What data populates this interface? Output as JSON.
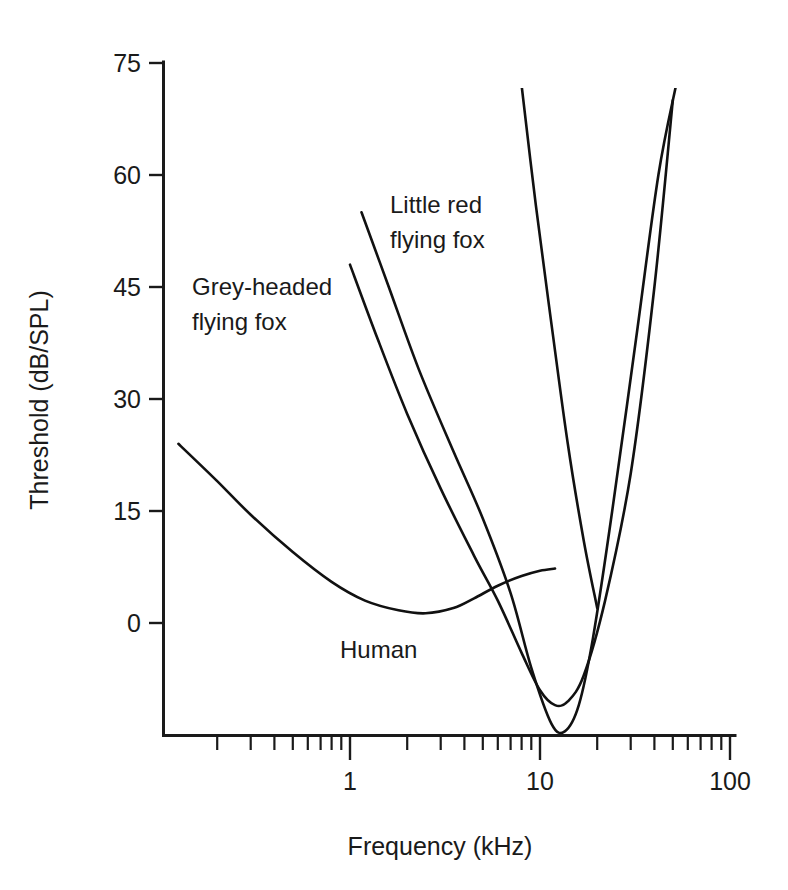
{
  "chart_data": {
    "type": "line",
    "title": "",
    "xlabel": "Frequency (kHz)",
    "ylabel": "Threshold (dB/SPL)",
    "xscale": "log",
    "xlim": [
      0.12,
      100
    ],
    "ylim": [
      -20,
      75
    ],
    "grid": false,
    "legend": "inline-annotations",
    "x_ticks": [
      "1",
      "10",
      "100"
    ],
    "x_tick_values": [
      1,
      10,
      100
    ],
    "y_ticks": [
      "0",
      "15",
      "30",
      "45",
      "60",
      "75"
    ],
    "y_tick_values": [
      0,
      15,
      30,
      45,
      60,
      75
    ],
    "series": [
      {
        "name": "Human",
        "label_text": "Human",
        "points": [
          [
            0.125,
            24.0
          ],
          [
            0.2,
            19.0
          ],
          [
            0.3,
            14.5
          ],
          [
            0.5,
            9.5
          ],
          [
            0.8,
            5.5
          ],
          [
            1.2,
            3.0
          ],
          [
            1.8,
            1.7
          ],
          [
            2.5,
            1.3
          ],
          [
            3.5,
            2.0
          ],
          [
            4.5,
            3.3
          ],
          [
            6.0,
            5.0
          ],
          [
            8.0,
            6.3
          ],
          [
            10.0,
            7.0
          ],
          [
            12.0,
            7.3
          ]
        ]
      },
      {
        "name": "Grey-headed flying fox",
        "label_text": "Grey-headed\nflying fox",
        "points": [
          [
            1.0,
            48.0
          ],
          [
            1.4,
            38.0
          ],
          [
            2.0,
            28.0
          ],
          [
            3.0,
            18.0
          ],
          [
            4.5,
            9.0
          ],
          [
            6.0,
            3.0
          ],
          [
            8.0,
            -4.0
          ],
          [
            10.0,
            -9.0
          ],
          [
            12.0,
            -11.0
          ],
          [
            14.0,
            -10.5
          ],
          [
            17.0,
            -7.0
          ],
          [
            22.0,
            3.0
          ],
          [
            30.0,
            20.0
          ],
          [
            40.0,
            45.0
          ],
          [
            50.0,
            70.0
          ]
        ]
      },
      {
        "name": "Little red flying fox",
        "label_text": "Little red\nflying fox",
        "points": [
          [
            1.15,
            55.0
          ],
          [
            1.6,
            45.0
          ],
          [
            2.3,
            34.0
          ],
          [
            3.5,
            23.0
          ],
          [
            5.0,
            14.0
          ],
          [
            7.0,
            4.0
          ],
          [
            9.0,
            -6.0
          ],
          [
            11.5,
            -13.5
          ],
          [
            13.5,
            -14.5
          ],
          [
            16.0,
            -11.0
          ],
          [
            19.0,
            -2.0
          ],
          [
            24.0,
            15.0
          ],
          [
            32.0,
            38.0
          ],
          [
            42.0,
            60.0
          ],
          [
            52.0,
            72.0
          ]
        ]
      },
      {
        "name": "Grey-headed flying fox upper branch",
        "label_text": "",
        "points": [
          [
            8.0,
            72.0
          ],
          [
            9.5,
            56.0
          ],
          [
            11.5,
            40.0
          ],
          [
            14.0,
            24.0
          ],
          [
            17.0,
            11.0
          ],
          [
            20.0,
            2.0
          ]
        ]
      }
    ],
    "annotations": [
      {
        "text": "Grey-headed flying fox",
        "x_px": 192,
        "y_px": 295
      },
      {
        "text": "Little red flying fox",
        "x_px": 390,
        "y_px": 213
      },
      {
        "text": "Human",
        "x_px": 340,
        "y_px": 658
      }
    ]
  },
  "labels": {
    "y_axis_title": "Threshold (dB/SPL)",
    "x_axis_title": "Frequency (kHz)",
    "y_tick_75": "75",
    "y_tick_60": "60",
    "y_tick_45": "45",
    "y_tick_30": "30",
    "y_tick_15": "15",
    "y_tick_0": "0",
    "x_tick_1": "1",
    "x_tick_10": "10",
    "x_tick_100": "100",
    "series_greyheaded_line1": "Grey-headed",
    "series_greyheaded_line2": "flying fox",
    "series_littlered_line1": "Little red",
    "series_littlered_line2": "flying fox",
    "series_human": "Human"
  },
  "colors": {
    "background": "#ffffff",
    "ink": "#1a1a1a",
    "curve": "#111111"
  }
}
